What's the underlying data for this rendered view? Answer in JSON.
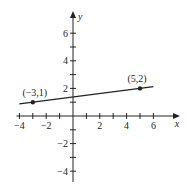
{
  "chart_data": {
    "type": "line",
    "title": "",
    "xlabel": "x",
    "ylabel": "y",
    "xlim": [
      -4,
      7.5
    ],
    "ylim": [
      -4.7,
      7.5
    ],
    "x_ticks": [
      -4,
      -3,
      -2,
      -1,
      1,
      2,
      3,
      4,
      5,
      6
    ],
    "x_tick_labels": [
      {
        "value": -4,
        "label": "−4"
      },
      {
        "value": -2,
        "label": "−2"
      },
      {
        "value": 2,
        "label": "2"
      },
      {
        "value": 4,
        "label": "4"
      },
      {
        "value": 6,
        "label": "6"
      }
    ],
    "y_ticks": [
      -4,
      -3,
      -2,
      -1,
      1,
      2,
      3,
      4,
      5,
      6
    ],
    "y_tick_labels": [
      {
        "value": 6,
        "label": "6"
      },
      {
        "value": 4,
        "label": "4"
      },
      {
        "value": 2,
        "label": "2"
      },
      {
        "value": -2,
        "label": "−2"
      },
      {
        "value": -4,
        "label": "−4"
      }
    ],
    "grid": false,
    "line": {
      "x_start": -4,
      "x_end": 6,
      "slope": 0.125,
      "intercept": 1.375
    },
    "points": [
      {
        "x": -3,
        "y": 1,
        "label": "(−3,1)"
      },
      {
        "x": 5,
        "y": 2,
        "label": "(5,2)"
      }
    ],
    "color": "#222222"
  }
}
